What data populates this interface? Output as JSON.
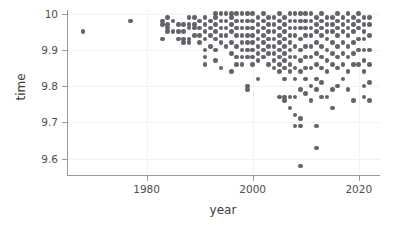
{
  "chart_data": {
    "type": "scatter",
    "title": "",
    "xlabel": "year",
    "ylabel": "time",
    "xlim": [
      1965,
      2024
    ],
    "ylim": [
      9.555,
      10.01
    ],
    "xticks": [
      1980,
      2000,
      2020
    ],
    "xtick_labels": [
      "1980",
      "2000",
      "2020"
    ],
    "yticks": [
      10,
      9.9,
      9.8,
      9.7,
      9.6
    ],
    "ytick_labels": [
      "10",
      "9.9",
      "9.8",
      "9.7",
      "9.6"
    ],
    "grid": true,
    "legend": null,
    "marker_color": "#56565c",
    "marker_size": 4.6,
    "series": [
      {
        "name": "100m sprint times",
        "points": [
          [
            1968,
            9.95
          ],
          [
            1977,
            9.98
          ],
          [
            1983,
            9.93
          ],
          [
            1983,
            9.97
          ],
          [
            1983,
            9.98
          ],
          [
            1984,
            9.96
          ],
          [
            1984,
            9.99
          ],
          [
            1984,
            9.95
          ],
          [
            1984,
            9.97
          ],
          [
            1985,
            9.98
          ],
          [
            1985,
            9.95
          ],
          [
            1986,
            9.93
          ],
          [
            1986,
            9.95
          ],
          [
            1986,
            9.97
          ],
          [
            1987,
            9.95
          ],
          [
            1987,
            9.97
          ],
          [
            1987,
            9.93
          ],
          [
            1987,
            9.92
          ],
          [
            1988,
            9.92
          ],
          [
            1988,
            9.93
          ],
          [
            1988,
            9.96
          ],
          [
            1988,
            9.99
          ],
          [
            1988,
            9.97
          ],
          [
            1989,
            9.94
          ],
          [
            1989,
            9.97
          ],
          [
            1989,
            9.99
          ],
          [
            1989,
            9.96
          ],
          [
            1990,
            9.96
          ],
          [
            1990,
            9.98
          ],
          [
            1990,
            9.94
          ],
          [
            1990,
            9.92
          ],
          [
            1991,
            9.86
          ],
          [
            1991,
            9.88
          ],
          [
            1991,
            9.9
          ],
          [
            1991,
            9.93
          ],
          [
            1991,
            9.95
          ],
          [
            1991,
            9.97
          ],
          [
            1991,
            9.99
          ],
          [
            1992,
            9.96
          ],
          [
            1992,
            9.98
          ],
          [
            1992,
            9.94
          ],
          [
            1992,
            9.91
          ],
          [
            1993,
            9.87
          ],
          [
            1993,
            9.9
          ],
          [
            1993,
            9.93
          ],
          [
            1993,
            9.95
          ],
          [
            1993,
            9.97
          ],
          [
            1993,
            9.99
          ],
          [
            1993,
            10.0
          ],
          [
            1994,
            9.85
          ],
          [
            1994,
            9.92
          ],
          [
            1994,
            9.94
          ],
          [
            1994,
            9.96
          ],
          [
            1994,
            9.98
          ],
          [
            1994,
            10.0
          ],
          [
            1995,
            9.91
          ],
          [
            1995,
            9.94
          ],
          [
            1995,
            9.96
          ],
          [
            1995,
            9.98
          ],
          [
            1995,
            10.0
          ],
          [
            1996,
            9.84
          ],
          [
            1996,
            9.89
          ],
          [
            1996,
            9.92
          ],
          [
            1996,
            9.95
          ],
          [
            1996,
            9.97
          ],
          [
            1996,
            9.99
          ],
          [
            1996,
            10.0
          ],
          [
            1997,
            9.86
          ],
          [
            1997,
            9.88
          ],
          [
            1997,
            9.91
          ],
          [
            1997,
            9.94
          ],
          [
            1997,
            9.96
          ],
          [
            1997,
            9.98
          ],
          [
            1997,
            10.0
          ],
          [
            1998,
            9.86
          ],
          [
            1998,
            9.88
          ],
          [
            1998,
            9.9
          ],
          [
            1998,
            9.92
          ],
          [
            1998,
            9.94
          ],
          [
            1998,
            9.96
          ],
          [
            1998,
            9.98
          ],
          [
            1998,
            10.0
          ],
          [
            1999,
            9.79
          ],
          [
            1999,
            9.8
          ],
          [
            1999,
            9.88
          ],
          [
            1999,
            9.9
          ],
          [
            1999,
            9.92
          ],
          [
            1999,
            9.94
          ],
          [
            1999,
            9.96
          ],
          [
            1999,
            9.98
          ],
          [
            1999,
            10.0
          ],
          [
            2000,
            9.86
          ],
          [
            2000,
            9.88
          ],
          [
            2000,
            9.9
          ],
          [
            2000,
            9.92
          ],
          [
            2000,
            9.94
          ],
          [
            2000,
            9.96
          ],
          [
            2000,
            9.98
          ],
          [
            2000,
            10.0
          ],
          [
            2001,
            9.82
          ],
          [
            2001,
            9.87
          ],
          [
            2001,
            9.89
          ],
          [
            2001,
            9.91
          ],
          [
            2001,
            9.93
          ],
          [
            2001,
            9.95
          ],
          [
            2001,
            9.97
          ],
          [
            2001,
            9.99
          ],
          [
            2002,
            9.88
          ],
          [
            2002,
            9.9
          ],
          [
            2002,
            9.92
          ],
          [
            2002,
            9.94
          ],
          [
            2002,
            9.96
          ],
          [
            2002,
            9.98
          ],
          [
            2002,
            10.0
          ],
          [
            2003,
            9.86
          ],
          [
            2003,
            9.89
          ],
          [
            2003,
            9.91
          ],
          [
            2003,
            9.93
          ],
          [
            2003,
            9.95
          ],
          [
            2003,
            9.97
          ],
          [
            2003,
            9.99
          ],
          [
            2004,
            9.85
          ],
          [
            2004,
            9.87
          ],
          [
            2004,
            9.89
          ],
          [
            2004,
            9.91
          ],
          [
            2004,
            9.93
          ],
          [
            2004,
            9.95
          ],
          [
            2004,
            9.97
          ],
          [
            2004,
            9.99
          ],
          [
            2005,
            9.77
          ],
          [
            2005,
            9.84
          ],
          [
            2005,
            9.86
          ],
          [
            2005,
            9.88
          ],
          [
            2005,
            9.9
          ],
          [
            2005,
            9.92
          ],
          [
            2005,
            9.94
          ],
          [
            2005,
            9.96
          ],
          [
            2005,
            9.98
          ],
          [
            2005,
            10.0
          ],
          [
            2006,
            9.76
          ],
          [
            2006,
            9.77
          ],
          [
            2006,
            9.82
          ],
          [
            2006,
            9.85
          ],
          [
            2006,
            9.87
          ],
          [
            2006,
            9.89
          ],
          [
            2006,
            9.91
          ],
          [
            2006,
            9.93
          ],
          [
            2006,
            9.95
          ],
          [
            2006,
            9.97
          ],
          [
            2006,
            9.99
          ],
          [
            2007,
            9.74
          ],
          [
            2007,
            9.77
          ],
          [
            2007,
            9.84
          ],
          [
            2007,
            9.86
          ],
          [
            2007,
            9.88
          ],
          [
            2007,
            9.9
          ],
          [
            2007,
            9.92
          ],
          [
            2007,
            9.94
          ],
          [
            2007,
            9.96
          ],
          [
            2007,
            9.98
          ],
          [
            2007,
            10.0
          ],
          [
            2008,
            9.69
          ],
          [
            2008,
            9.72
          ],
          [
            2008,
            9.77
          ],
          [
            2008,
            9.82
          ],
          [
            2008,
            9.85
          ],
          [
            2008,
            9.88
          ],
          [
            2008,
            9.91
          ],
          [
            2008,
            9.94
          ],
          [
            2008,
            9.96
          ],
          [
            2008,
            9.98
          ],
          [
            2008,
            10.0
          ],
          [
            2009,
            9.58
          ],
          [
            2009,
            9.69
          ],
          [
            2009,
            9.71
          ],
          [
            2009,
            9.79
          ],
          [
            2009,
            9.84
          ],
          [
            2009,
            9.87
          ],
          [
            2009,
            9.9
          ],
          [
            2009,
            9.93
          ],
          [
            2009,
            9.96
          ],
          [
            2009,
            9.98
          ],
          [
            2009,
            10.0
          ],
          [
            2010,
            9.78
          ],
          [
            2010,
            9.82
          ],
          [
            2010,
            9.85
          ],
          [
            2010,
            9.88
          ],
          [
            2010,
            9.91
          ],
          [
            2010,
            9.94
          ],
          [
            2010,
            9.96
          ],
          [
            2010,
            9.98
          ],
          [
            2010,
            10.0
          ],
          [
            2011,
            9.76
          ],
          [
            2011,
            9.8
          ],
          [
            2011,
            9.85
          ],
          [
            2011,
            9.88
          ],
          [
            2011,
            9.91
          ],
          [
            2011,
            9.94
          ],
          [
            2011,
            9.96
          ],
          [
            2011,
            9.98
          ],
          [
            2011,
            10.0
          ],
          [
            2012,
            9.63
          ],
          [
            2012,
            9.69
          ],
          [
            2012,
            9.79
          ],
          [
            2012,
            9.82
          ],
          [
            2012,
            9.86
          ],
          [
            2012,
            9.89
          ],
          [
            2012,
            9.92
          ],
          [
            2012,
            9.95
          ],
          [
            2012,
            9.97
          ],
          [
            2012,
            9.99
          ],
          [
            2013,
            9.77
          ],
          [
            2013,
            9.81
          ],
          [
            2013,
            9.85
          ],
          [
            2013,
            9.88
          ],
          [
            2013,
            9.91
          ],
          [
            2013,
            9.94
          ],
          [
            2013,
            9.96
          ],
          [
            2013,
            9.98
          ],
          [
            2013,
            10.0
          ],
          [
            2014,
            9.77
          ],
          [
            2014,
            9.84
          ],
          [
            2014,
            9.87
          ],
          [
            2014,
            9.9
          ],
          [
            2014,
            9.93
          ],
          [
            2014,
            9.95
          ],
          [
            2014,
            9.97
          ],
          [
            2014,
            9.99
          ],
          [
            2015,
            9.74
          ],
          [
            2015,
            9.79
          ],
          [
            2015,
            9.86
          ],
          [
            2015,
            9.89
          ],
          [
            2015,
            9.92
          ],
          [
            2015,
            9.95
          ],
          [
            2015,
            9.97
          ],
          [
            2015,
            9.99
          ],
          [
            2016,
            9.8
          ],
          [
            2016,
            9.85
          ],
          [
            2016,
            9.88
          ],
          [
            2016,
            9.91
          ],
          [
            2016,
            9.94
          ],
          [
            2016,
            9.96
          ],
          [
            2016,
            9.98
          ],
          [
            2016,
            10.0
          ],
          [
            2017,
            9.82
          ],
          [
            2017,
            9.86
          ],
          [
            2017,
            9.89
          ],
          [
            2017,
            9.92
          ],
          [
            2017,
            9.95
          ],
          [
            2017,
            9.97
          ],
          [
            2017,
            9.99
          ],
          [
            2018,
            9.79
          ],
          [
            2018,
            9.84
          ],
          [
            2018,
            9.88
          ],
          [
            2018,
            9.91
          ],
          [
            2018,
            9.94
          ],
          [
            2018,
            9.96
          ],
          [
            2018,
            9.98
          ],
          [
            2018,
            10.0
          ],
          [
            2019,
            9.76
          ],
          [
            2019,
            9.86
          ],
          [
            2019,
            9.89
          ],
          [
            2019,
            9.92
          ],
          [
            2019,
            9.95
          ],
          [
            2019,
            9.97
          ],
          [
            2019,
            9.99
          ],
          [
            2020,
            9.86
          ],
          [
            2020,
            9.9
          ],
          [
            2020,
            9.93
          ],
          [
            2020,
            9.96
          ],
          [
            2020,
            9.98
          ],
          [
            2020,
            10.0
          ],
          [
            2021,
            9.77
          ],
          [
            2021,
            9.8
          ],
          [
            2021,
            9.84
          ],
          [
            2021,
            9.87
          ],
          [
            2021,
            9.9
          ],
          [
            2021,
            9.93
          ],
          [
            2021,
            9.95
          ],
          [
            2021,
            9.97
          ],
          [
            2021,
            9.99
          ],
          [
            2022,
            9.76
          ],
          [
            2022,
            9.81
          ],
          [
            2022,
            9.86
          ],
          [
            2022,
            9.9
          ],
          [
            2022,
            9.94
          ],
          [
            2022,
            9.97
          ],
          [
            2022,
            9.99
          ]
        ]
      }
    ]
  }
}
